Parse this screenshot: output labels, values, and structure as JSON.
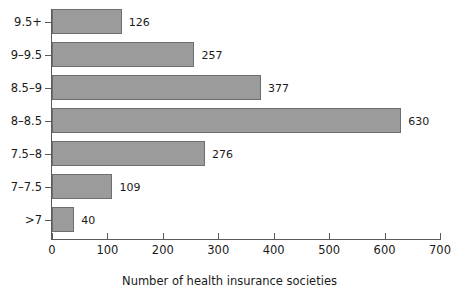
{
  "chart_data": {
    "type": "bar",
    "orientation": "horizontal",
    "title": "",
    "xlabel": "Number of health insurance societies",
    "ylabel": "",
    "categories": [
      "9.5+",
      "9–9.5",
      "8.5–9",
      "8–8.5",
      "7.5–8",
      "7–7.5",
      ">7"
    ],
    "values": [
      126,
      257,
      377,
      630,
      276,
      109,
      40
    ],
    "value_labels": [
      "126",
      "257",
      "377",
      "630",
      "276",
      "109",
      "40"
    ],
    "xlim": [
      0,
      700
    ],
    "xticks": [
      0,
      100,
      200,
      300,
      400,
      500,
      600,
      700
    ],
    "xtick_labels": [
      "0",
      "100",
      "200",
      "300",
      "400",
      "500",
      "600",
      "700"
    ],
    "grid": false,
    "legend": null,
    "bar_color": "#9b9b9b",
    "bar_edge_color": "#6e6e6e",
    "axis_color": "#5b5b5b",
    "background": "#ffffff",
    "text_color": "#1a1a1a"
  }
}
